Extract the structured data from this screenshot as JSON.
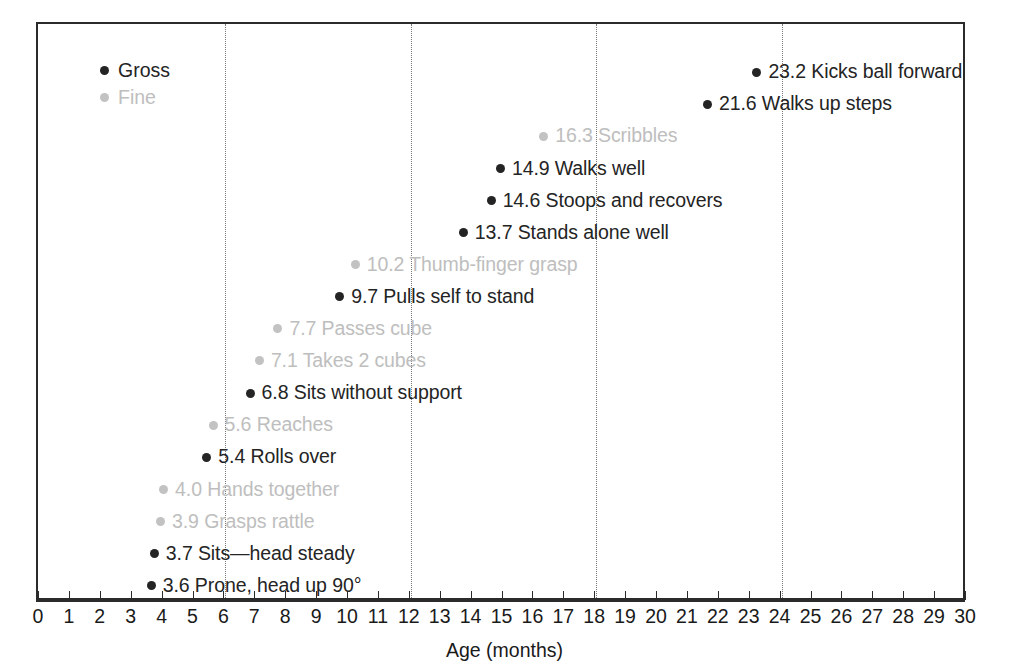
{
  "chart_data": {
    "type": "scatter",
    "title": "",
    "xlabel": "Age (months)",
    "ylabel": "",
    "xlim": [
      0,
      30
    ],
    "grid": "vertical dotted at 6, 12, 18, 24",
    "legend_position": "top-left inside plot",
    "gridline_values": [
      6,
      12,
      18,
      24
    ],
    "xticks": [
      "0",
      "1",
      "2",
      "3",
      "4",
      "5",
      "6",
      "7",
      "8",
      "9",
      "10",
      "11",
      "12",
      "13",
      "14",
      "15",
      "16",
      "17",
      "18",
      "19",
      "20",
      "21",
      "22",
      "23",
      "24",
      "25",
      "26",
      "27",
      "28",
      "29",
      "30"
    ],
    "colors": {
      "gross": "#242424",
      "fine": "#bebebe",
      "frame": "#2b2b2b",
      "grid": "#777777"
    },
    "series": [
      {
        "name": "Gross",
        "key": "gross"
      },
      {
        "name": "Fine",
        "key": "fine"
      }
    ],
    "points": [
      {
        "value": 23.2,
        "label": "23.2 Kicks ball forward",
        "series": "gross"
      },
      {
        "value": 21.6,
        "label": "21.6 Walks up steps",
        "series": "gross"
      },
      {
        "value": 16.3,
        "label": "16.3 Scribbles",
        "series": "fine"
      },
      {
        "value": 14.9,
        "label": "14.9 Walks well",
        "series": "gross"
      },
      {
        "value": 14.6,
        "label": "14.6 Stoops and recovers",
        "series": "gross"
      },
      {
        "value": 13.7,
        "label": "13.7 Stands alone well",
        "series": "gross"
      },
      {
        "value": 10.2,
        "label": "10.2 Thumb-finger grasp",
        "series": "fine"
      },
      {
        "value": 9.7,
        "label": "9.7 Pulls self to stand",
        "series": "gross"
      },
      {
        "value": 7.7,
        "label": "7.7 Passes cube",
        "series": "fine"
      },
      {
        "value": 7.1,
        "label": "7.1 Takes 2 cubes",
        "series": "fine"
      },
      {
        "value": 6.8,
        "label": "6.8 Sits without support",
        "series": "gross"
      },
      {
        "value": 5.6,
        "label": "5.6 Reaches",
        "series": "fine"
      },
      {
        "value": 5.4,
        "label": "5.4 Rolls over",
        "series": "gross"
      },
      {
        "value": 4.0,
        "label": "4.0 Hands together",
        "series": "fine"
      },
      {
        "value": 3.9,
        "label": "3.9 Grasps rattle",
        "series": "fine"
      },
      {
        "value": 3.7,
        "label": "3.7 Sits—head steady",
        "series": "gross"
      },
      {
        "value": 3.6,
        "label": "3.6 Prone, head up 90°",
        "series": "gross"
      }
    ]
  },
  "legend": {
    "items": [
      {
        "label": "Gross",
        "series": "gross"
      },
      {
        "label": "Fine",
        "series": "fine"
      }
    ]
  },
  "axis": {
    "title": "Age (months)"
  }
}
